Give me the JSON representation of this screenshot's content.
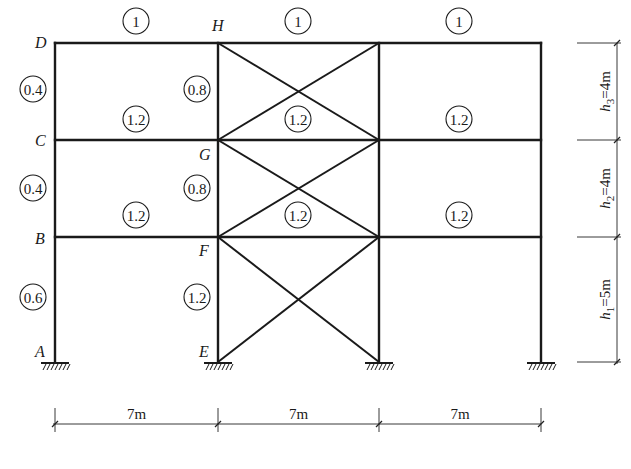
{
  "diagram": {
    "columns_x": [
      55,
      218,
      379,
      541
    ],
    "levels_y": [
      362,
      237,
      140,
      43
    ],
    "nodes": [
      {
        "label": "A",
        "x": 35,
        "y": 357
      },
      {
        "label": "B",
        "x": 35,
        "y": 244
      },
      {
        "label": "C",
        "x": 35,
        "y": 146
      },
      {
        "label": "D",
        "x": 35,
        "y": 48
      },
      {
        "label": "E",
        "x": 199,
        "y": 357
      },
      {
        "label": "F",
        "x": 199,
        "y": 256
      },
      {
        "label": "G",
        "x": 199,
        "y": 160
      },
      {
        "label": "H",
        "x": 212,
        "y": 31
      }
    ],
    "relative_stiffness": {
      "beams": [
        {
          "value": "1",
          "x": 136,
          "y": 21
        },
        {
          "value": "1",
          "x": 298,
          "y": 21
        },
        {
          "value": "1",
          "x": 459,
          "y": 21
        },
        {
          "value": "1.2",
          "x": 136,
          "y": 119
        },
        {
          "value": "1.2",
          "x": 298,
          "y": 119
        },
        {
          "value": "1.2",
          "x": 459,
          "y": 119
        },
        {
          "value": "1.2",
          "x": 136,
          "y": 215
        },
        {
          "value": "1.2",
          "x": 298,
          "y": 215
        },
        {
          "value": "1.2",
          "x": 459,
          "y": 215
        }
      ],
      "columns": [
        {
          "value": "0.4",
          "x": 33,
          "y": 89
        },
        {
          "value": "0.8",
          "x": 197,
          "y": 89
        },
        {
          "value": "0.4",
          "x": 33,
          "y": 188
        },
        {
          "value": "0.8",
          "x": 197,
          "y": 188
        },
        {
          "value": "0.6",
          "x": 33,
          "y": 297
        },
        {
          "value": "1.2",
          "x": 197,
          "y": 297
        }
      ]
    },
    "storey_heights": [
      {
        "label_var": "h",
        "sub": "3",
        "value": "=4m",
        "y_top": 43,
        "y_bot": 140
      },
      {
        "label_var": "h",
        "sub": "2",
        "value": "=4m",
        "y_top": 140,
        "y_bot": 237
      },
      {
        "label_var": "h",
        "sub": "1",
        "value": "=5m",
        "y_top": 237,
        "y_bot": 362
      }
    ],
    "bay_widths": [
      {
        "label": "7m",
        "x1": 55,
        "x2": 218
      },
      {
        "label": "7m",
        "x1": 218,
        "x2": 379
      },
      {
        "label": "7m",
        "x1": 379,
        "x2": 541
      }
    ],
    "colors": {
      "line": "#1a1a1a",
      "background": "#ffffff"
    }
  }
}
